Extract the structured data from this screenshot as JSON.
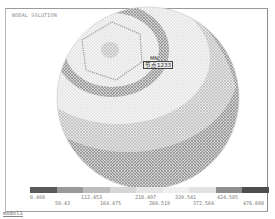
{
  "window": {
    "title": "NODAL SOLUTION",
    "footer_label": "model1"
  },
  "viewport": {
    "object": "sphere mesh contour plot",
    "node_marker": "MN",
    "node_label": "节点1233"
  },
  "legend": {
    "colors": [
      "#5a5a5a",
      "#9a9a9a",
      "#bdbdbd",
      "#d6d6d6",
      "#e6e6e6",
      "#efefef",
      "#e2e2e2",
      "#c8c8c8",
      "#8e8e8e"
    ],
    "ticks_top": [
      "0.408",
      "112.453",
      "218.497",
      "320.541",
      "424.585"
    ],
    "ticks_bottom": [
      "50.43",
      "164.475",
      "268.519",
      "372.564",
      "476.608"
    ]
  }
}
